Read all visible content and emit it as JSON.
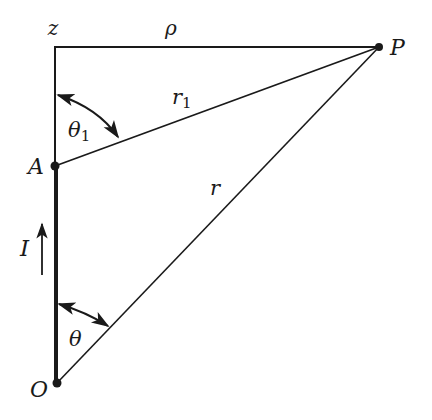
{
  "diagram": {
    "type": "geometry-figure",
    "colors": {
      "ink": "#1a1a1a",
      "background": "#ffffff"
    },
    "labels": {
      "z_axis": "z",
      "rho": "ρ",
      "point_P": "P",
      "point_A": "A",
      "point_O": "O",
      "r1": "r",
      "r1_sub": "1",
      "r": "r",
      "theta1": "θ",
      "theta1_sub": "1",
      "theta": "θ",
      "current": "I"
    },
    "points": {
      "corner_z": [
        55,
        47
      ],
      "P": [
        379,
        47
      ],
      "A": [
        55,
        166
      ],
      "O": [
        57,
        383
      ]
    },
    "segments": [
      {
        "name": "z-axis-line",
        "from": "O",
        "to": "corner_z"
      },
      {
        "name": "rho-line",
        "from": "corner_z",
        "to": "P"
      },
      {
        "name": "r1-line",
        "from": "A",
        "to": "P"
      },
      {
        "name": "r-line",
        "from": "O",
        "to": "P"
      },
      {
        "name": "wire-OA",
        "from": "O",
        "to": "A",
        "thick": true
      }
    ],
    "angles": [
      {
        "name": "theta1",
        "vertex": "A",
        "between": [
          "z-axis",
          "r1"
        ]
      },
      {
        "name": "theta",
        "vertex": "O",
        "between": [
          "z-axis",
          "r"
        ]
      }
    ],
    "current_arrow": {
      "direction": "up",
      "label": "I"
    }
  }
}
